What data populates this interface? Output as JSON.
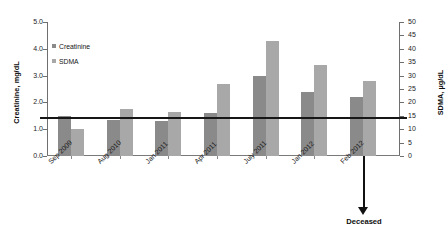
{
  "chart_data": {
    "type": "bar",
    "title": "",
    "subtitle": "",
    "categories": [
      "Sep 2009",
      "Aug 2010",
      "Jan 2011",
      "Apr 2011",
      "July 2011",
      "Jan 2012",
      "Feb 2012"
    ],
    "series": [
      {
        "name": "Creatinine",
        "axis": "left",
        "unit": "mg/dL",
        "color": "#8a8a8a",
        "values": [
          1.5,
          1.35,
          1.3,
          1.6,
          3.0,
          2.4,
          2.2
        ]
      },
      {
        "name": "SDMA",
        "axis": "right",
        "unit": "µg/dL",
        "color": "#a8a8a8",
        "values": [
          10,
          17.5,
          16.5,
          27,
          43,
          34,
          28
        ]
      }
    ],
    "ylabel": "Creatinine, mg/dL",
    "ylabel_right": "SDMA, µg/dL",
    "xlabel": "",
    "ylim": [
      0.0,
      5.0
    ],
    "ylim_right": [
      0,
      50
    ],
    "yticks": [
      "0.0",
      "1.0",
      "2.0",
      "3.0",
      "4.0",
      "5.0"
    ],
    "yticks_right": [
      "0",
      "5",
      "10",
      "15",
      "20",
      "25",
      "30",
      "35",
      "40",
      "45",
      "50"
    ],
    "grid": false,
    "legend_position": "upper-left",
    "reference_line": {
      "value_left": 1.45,
      "value_right": 14,
      "color": "#161616"
    },
    "annotations": [
      {
        "name": "deceased",
        "label": "Deceased",
        "at_category": "Feb 2012"
      }
    ]
  },
  "legend": {
    "items": [
      {
        "label": "Creatinine",
        "color": "#8a8a8a"
      },
      {
        "label": "SDMA",
        "color": "#a8a8a8"
      }
    ]
  },
  "axes": {
    "left_title": "Creatinine, mg/dL",
    "right_title": "SDMA, µg/dL"
  },
  "annotation": {
    "deceased_label": "Deceased"
  }
}
